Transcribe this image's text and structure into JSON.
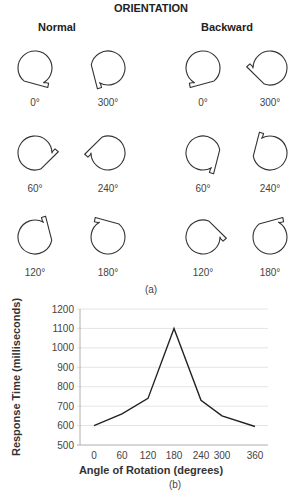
{
  "panel_a": {
    "title": "ORIENTATION",
    "groups": [
      {
        "label": "Normal",
        "items": [
          {
            "angle_label": "0°",
            "rotation": 0
          },
          {
            "angle_label": "300°",
            "rotation": 300
          },
          {
            "angle_label": "60°",
            "rotation": 60
          },
          {
            "angle_label": "240°",
            "rotation": 240
          },
          {
            "angle_label": "120°",
            "rotation": 120
          },
          {
            "angle_label": "180°",
            "rotation": 180
          }
        ]
      },
      {
        "label": "Backward",
        "items": [
          {
            "angle_label": "0°",
            "rotation": 0
          },
          {
            "angle_label": "300°",
            "rotation": 300
          },
          {
            "angle_label": "60°",
            "rotation": 60
          },
          {
            "angle_label": "240°",
            "rotation": 240
          },
          {
            "angle_label": "120°",
            "rotation": 120
          },
          {
            "angle_label": "180°",
            "rotation": 180
          }
        ]
      }
    ],
    "caption": "(a)"
  },
  "panel_b": {
    "caption": "(b)"
  },
  "chart_data": {
    "type": "line",
    "title": "",
    "xlabel": "Angle of Rotation (degrees)",
    "ylabel": "Response Time (milliseconds)",
    "categories": [
      "0",
      "60",
      "120",
      "180",
      "240",
      "300",
      "360"
    ],
    "values": [
      600,
      660,
      740,
      1100,
      730,
      650,
      595
    ],
    "yticks": [
      500,
      600,
      700,
      800,
      900,
      1000,
      1100,
      1200
    ],
    "ylim": [
      500,
      1200
    ],
    "grid": true,
    "legend": "none"
  }
}
